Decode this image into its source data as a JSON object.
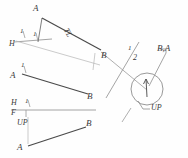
{
  "drawing": {
    "title": "Descriptive geometry: point view of line AB",
    "ink_color": "#4a4a4a",
    "ink_color_light": "#9a9a9a",
    "background": "#fefefe",
    "width": 188,
    "height": 158
  },
  "views": {
    "horizontal_view": {
      "name": "H",
      "point_a_label": "A",
      "point_b_label": "B",
      "true_length_label": "TL",
      "fold_label_top": "H",
      "fold_tick_left": "1",
      "fold_tick_right": "1"
    },
    "auxiliary_view_1": {
      "point_a_label": "A",
      "point_b_label": "B",
      "fold_tick": "1"
    },
    "front_view": {
      "fold_label_h": "H",
      "fold_label_f": "F",
      "fold_tick_h": "1",
      "fold_tick_f": "1",
      "up_label": "UP",
      "point_a_label": "A",
      "point_b_label": "B"
    },
    "point_view": {
      "fold_label_upper": "1",
      "fold_label_lower": "2",
      "point_label": "B,A",
      "up_label": "UP"
    }
  }
}
